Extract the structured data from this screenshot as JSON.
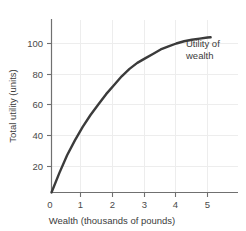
{
  "chart_data": {
    "type": "line",
    "title": "",
    "xlabel": "Wealth (thousands of pounds)",
    "ylabel": "Total utility (units)",
    "xlim": [
      0,
      5.4
    ],
    "ylim": [
      0,
      115
    ],
    "xticks": [
      "0",
      "1",
      "2",
      "3",
      "4",
      "5"
    ],
    "xtick_values": [
      0,
      1,
      2,
      3,
      4,
      5
    ],
    "yticks": [
      "20",
      "40",
      "60",
      "80",
      "100"
    ],
    "ytick_values": [
      20,
      40,
      60,
      80,
      100
    ],
    "grid": true,
    "legend": "none",
    "annotations": [
      {
        "name": "utility-of-wealth-label",
        "line1": "Utility of",
        "line2": "wealth"
      }
    ],
    "series": [
      {
        "name": "Utility of wealth",
        "color": "#3b3b3b",
        "x": [
          0,
          0.25,
          0.5,
          0.75,
          1,
          1.25,
          1.5,
          1.75,
          2,
          2.25,
          2.5,
          2.75,
          3,
          3.25,
          3.5,
          3.75,
          4,
          4.25,
          4.5,
          4.75,
          5,
          5.1
        ],
        "y": [
          0,
          13,
          25,
          35,
          44,
          52,
          59,
          66,
          72,
          78,
          83,
          87,
          90,
          93,
          96,
          98,
          100,
          101.5,
          102.5,
          103.3,
          104,
          104.2
        ]
      }
    ],
    "colors": {
      "curve": "#3b3b3b",
      "axis": "#6e6e6e",
      "grid": "#ececec",
      "text": "#3c3c3c",
      "background": "#ffffff"
    }
  },
  "axis_labels": {
    "x_title": "Wealth (thousands of pounds)",
    "y_title": "Total utility (units)"
  },
  "x_tick_labels": {
    "t0": "0",
    "t1": "1",
    "t2": "2",
    "t3": "3",
    "t4": "4",
    "t5": "5"
  },
  "y_tick_labels": {
    "t20": "20",
    "t40": "40",
    "t60": "60",
    "t80": "80",
    "t100": "100"
  },
  "annotation": {
    "line1": "Utility of",
    "line2": "wealth"
  }
}
